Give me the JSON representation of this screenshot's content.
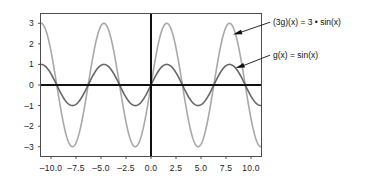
{
  "chart_data": {
    "type": "line",
    "title": "",
    "xlabel": "",
    "ylabel": "",
    "xlim": [
      -11.0,
      11.0
    ],
    "ylim": [
      -3.45,
      3.45
    ],
    "grid": false,
    "legend_position": "annotations-right",
    "xticks": [
      "-10.0",
      "-7.5",
      "-5.0",
      "-2.5",
      "0.0",
      "2.5",
      "5.0",
      "7.5",
      "10.0"
    ],
    "xtick_values": [
      -10.0,
      -7.5,
      -5.0,
      -2.5,
      0.0,
      2.5,
      5.0,
      7.5,
      10.0
    ],
    "yticks": [
      "3",
      "2",
      "1",
      "0",
      "-1",
      "-2",
      "-3"
    ],
    "ytick_values": [
      3,
      2,
      1,
      0,
      -1,
      -2,
      -3
    ],
    "series": [
      {
        "name": "(3g)(x) = 3 • sin(x)",
        "expression": "3*sin(x)",
        "amplitude": 3,
        "period": 6.283185,
        "color": "#a8a8a8",
        "linewidth": 1.6,
        "x": [
          -11.0,
          -10.78,
          -10.56,
          -10.34,
          -10.12,
          -9.9,
          -9.68,
          -9.46,
          -9.24,
          -9.02,
          -8.8,
          -8.58,
          -8.36,
          -8.14,
          -7.92,
          -7.7,
          -7.48,
          -7.26,
          -7.04,
          -6.82,
          -6.6,
          -6.38,
          -6.16,
          -5.94,
          -5.72,
          -5.5,
          -5.28,
          -5.06,
          -4.84,
          -4.62,
          -4.4,
          -4.18,
          -3.96,
          -3.74,
          -3.52,
          -3.3,
          -3.08,
          -2.86,
          -2.64,
          -2.42,
          -2.2,
          -1.98,
          -1.76,
          -1.54,
          -1.32,
          -1.1,
          -0.88,
          -0.66,
          -0.44,
          -0.22,
          0.0,
          0.22,
          0.44,
          0.66,
          0.88,
          1.1,
          1.32,
          1.54,
          1.76,
          1.98,
          2.2,
          2.42,
          2.64,
          2.86,
          3.08,
          3.3,
          3.52,
          3.74,
          3.96,
          4.18,
          4.4,
          4.62,
          4.84,
          5.06,
          5.28,
          5.5,
          5.72,
          5.94,
          6.16,
          6.38,
          6.6,
          6.82,
          7.04,
          7.26,
          7.48,
          7.7,
          7.92,
          8.14,
          8.36,
          8.58,
          8.8,
          9.02,
          9.24,
          9.46,
          9.68,
          9.9,
          10.12,
          10.34,
          10.56,
          10.78,
          11.0
        ]
      },
      {
        "name": "g(x) = sin(x)",
        "expression": "sin(x)",
        "amplitude": 1,
        "period": 6.283185,
        "color": "#666666",
        "linewidth": 1.6,
        "x": [
          -11.0,
          -10.78,
          -10.56,
          -10.34,
          -10.12,
          -9.9,
          -9.68,
          -9.46,
          -9.24,
          -9.02,
          -8.8,
          -8.58,
          -8.36,
          -8.14,
          -7.92,
          -7.7,
          -7.48,
          -7.26,
          -7.04,
          -6.82,
          -6.6,
          -6.38,
          -6.16,
          -5.94,
          -5.72,
          -5.5,
          -5.28,
          -5.06,
          -4.84,
          -4.62,
          -4.4,
          -4.18,
          -3.96,
          -3.74,
          -3.52,
          -3.3,
          -3.08,
          -2.86,
          -2.64,
          -2.42,
          -2.2,
          -1.98,
          -1.76,
          -1.54,
          -1.32,
          -1.1,
          -0.88,
          -0.66,
          -0.44,
          -0.22,
          0.0,
          0.22,
          0.44,
          0.66,
          0.88,
          1.1,
          1.32,
          1.54,
          1.76,
          1.98,
          2.2,
          2.42,
          2.64,
          2.86,
          3.08,
          3.3,
          3.52,
          3.74,
          3.96,
          4.18,
          4.4,
          4.62,
          4.84,
          5.06,
          5.28,
          5.5,
          5.72,
          5.94,
          6.16,
          6.38,
          6.6,
          6.82,
          7.04,
          7.26,
          7.48,
          7.7,
          7.92,
          8.14,
          8.36,
          8.58,
          8.8,
          9.02,
          9.24,
          9.46,
          9.68,
          9.9,
          10.12,
          10.34,
          10.56,
          10.78,
          11.0
        ]
      }
    ],
    "annotations": [
      {
        "id": "annotation-3sin",
        "text": "(3g)(x) = 3 • sin(x)",
        "points_to": [
          8.2,
          2.45
        ],
        "label_at": [
          11.9,
          3.05
        ]
      },
      {
        "id": "annotation-sin",
        "text": "g(x) = sin(x)",
        "points_to": [
          8.45,
          0.82
        ],
        "label_at": [
          11.9,
          1.45
        ]
      }
    ],
    "axis_lines": {
      "x_axis_y": 0,
      "y_axis_x": 0,
      "color": "#111111"
    },
    "frame_color": "#4d4d4d"
  }
}
